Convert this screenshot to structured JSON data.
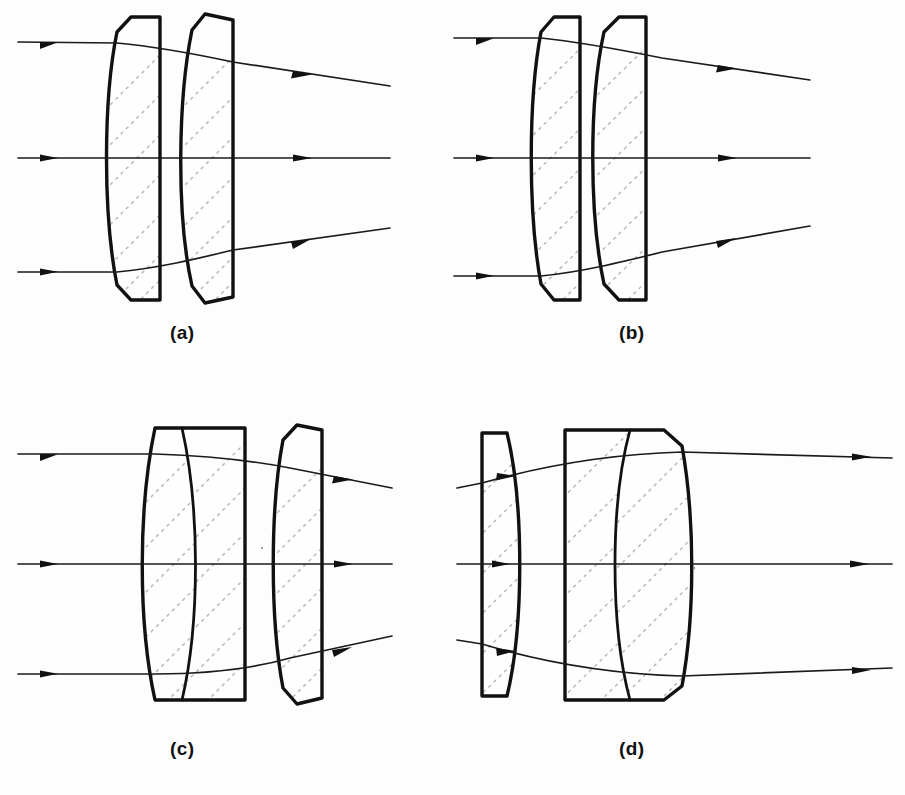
{
  "figure": {
    "background_color": "#fdfdfd",
    "ink_color": "#111111",
    "hatch_color": "#b9b9b9",
    "panel_count": 4
  },
  "panels": [
    {
      "id": "a",
      "caption": "(a)",
      "description": "Two separated meniscus elements, both convex toward the object; parallel input rays exit diverging.",
      "element_count": 2,
      "elements": [
        {
          "name": "meniscus-front",
          "type": "meniscus",
          "left_surface": "convex",
          "right_surface": "flat"
        },
        {
          "name": "meniscus-rear",
          "type": "meniscus",
          "left_surface": "convex",
          "right_surface": "flat"
        }
      ],
      "rays": [
        {
          "name": "upper-ray",
          "input": "parallel",
          "output": "diverging-down"
        },
        {
          "name": "axial-ray",
          "input": "parallel",
          "output": "straight"
        },
        {
          "name": "lower-ray",
          "input": "parallel",
          "output": "diverging-up"
        }
      ]
    },
    {
      "id": "b",
      "caption": "(b)",
      "description": "Two closely spaced narrow meniscus elements; parallel input rays exit diverging.",
      "element_count": 2,
      "elements": [
        {
          "name": "meniscus-front",
          "type": "meniscus",
          "left_surface": "convex",
          "right_surface": "flat"
        },
        {
          "name": "meniscus-rear",
          "type": "meniscus",
          "left_surface": "convex",
          "right_surface": "flat"
        }
      ],
      "rays": [
        {
          "name": "upper-ray",
          "input": "parallel",
          "output": "diverging-down"
        },
        {
          "name": "axial-ray",
          "input": "parallel",
          "output": "straight"
        },
        {
          "name": "lower-ray",
          "input": "parallel",
          "output": "diverging-up"
        }
      ]
    },
    {
      "id": "c",
      "caption": "(c)",
      "description": "Cemented doublet (biconvex crown plus negative flint with flat rear face) followed by a separated meniscus; parallel input rays exit diverging.",
      "element_count": 3,
      "elements": [
        {
          "name": "doublet-positive",
          "type": "biconvex",
          "left_surface": "convex",
          "right_surface": "convex"
        },
        {
          "name": "doublet-negative",
          "type": "negative-meniscus",
          "left_surface": "concave",
          "right_surface": "flat"
        },
        {
          "name": "meniscus-rear",
          "type": "meniscus",
          "left_surface": "convex",
          "right_surface": "flat"
        }
      ],
      "rays": [
        {
          "name": "upper-ray",
          "input": "parallel",
          "output": "diverging-down"
        },
        {
          "name": "axial-ray",
          "input": "parallel",
          "output": "straight"
        },
        {
          "name": "lower-ray",
          "input": "parallel",
          "output": "diverging-up"
        }
      ]
    },
    {
      "id": "d",
      "caption": "(d)",
      "description": "Separated plano-convex meniscus followed by a cemented doublet (negative flint with flat front face plus biconvex crown); converging input rays exit nearly parallel.",
      "element_count": 3,
      "elements": [
        {
          "name": "meniscus-front",
          "type": "plano-convex-meniscus",
          "left_surface": "flat",
          "right_surface": "convex"
        },
        {
          "name": "doublet-negative",
          "type": "negative-element",
          "left_surface": "flat",
          "right_surface": "concave"
        },
        {
          "name": "doublet-positive",
          "type": "biconvex",
          "left_surface": "convex",
          "right_surface": "convex"
        }
      ],
      "rays": [
        {
          "name": "upper-ray",
          "input": "converging",
          "output": "near-parallel"
        },
        {
          "name": "axial-ray",
          "input": "parallel",
          "output": "straight"
        },
        {
          "name": "lower-ray",
          "input": "converging",
          "output": "near-parallel"
        }
      ]
    }
  ]
}
